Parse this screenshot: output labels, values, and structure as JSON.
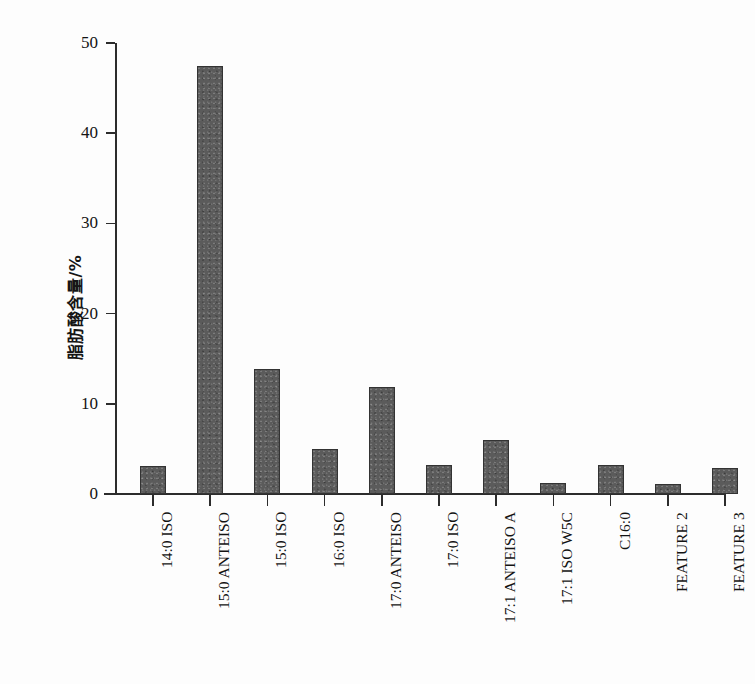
{
  "chart_data": {
    "type": "bar",
    "title": "",
    "xlabel": "",
    "ylabel": "脂肪酸含量/%",
    "ylim": [
      0,
      50
    ],
    "ytick_values": [
      0,
      10,
      20,
      30,
      40,
      50
    ],
    "ytick_labels": [
      "0",
      "10",
      "20",
      "30",
      "40",
      "50"
    ],
    "grid": false,
    "legend": null,
    "categories": [
      "14:0 ISO",
      "15:0 ANTEISO",
      "15:0 ISO",
      "16:0 ISO",
      "17:0 ANTEISO",
      "17:0 ISO",
      "17:1 ANTEISO A",
      "17:1 ISO W5C",
      "C16:0",
      "FEATURE 2",
      "FEATURE 3"
    ],
    "values": [
      3.1,
      47.4,
      13.9,
      5.0,
      11.9,
      3.2,
      6.0,
      1.2,
      3.2,
      1.1,
      2.9
    ],
    "bar_color": "#5b5b5b",
    "bar_edge_color": "#333333",
    "axis_color": "#2c2c2c",
    "background_color": "#fdfdfd"
  }
}
